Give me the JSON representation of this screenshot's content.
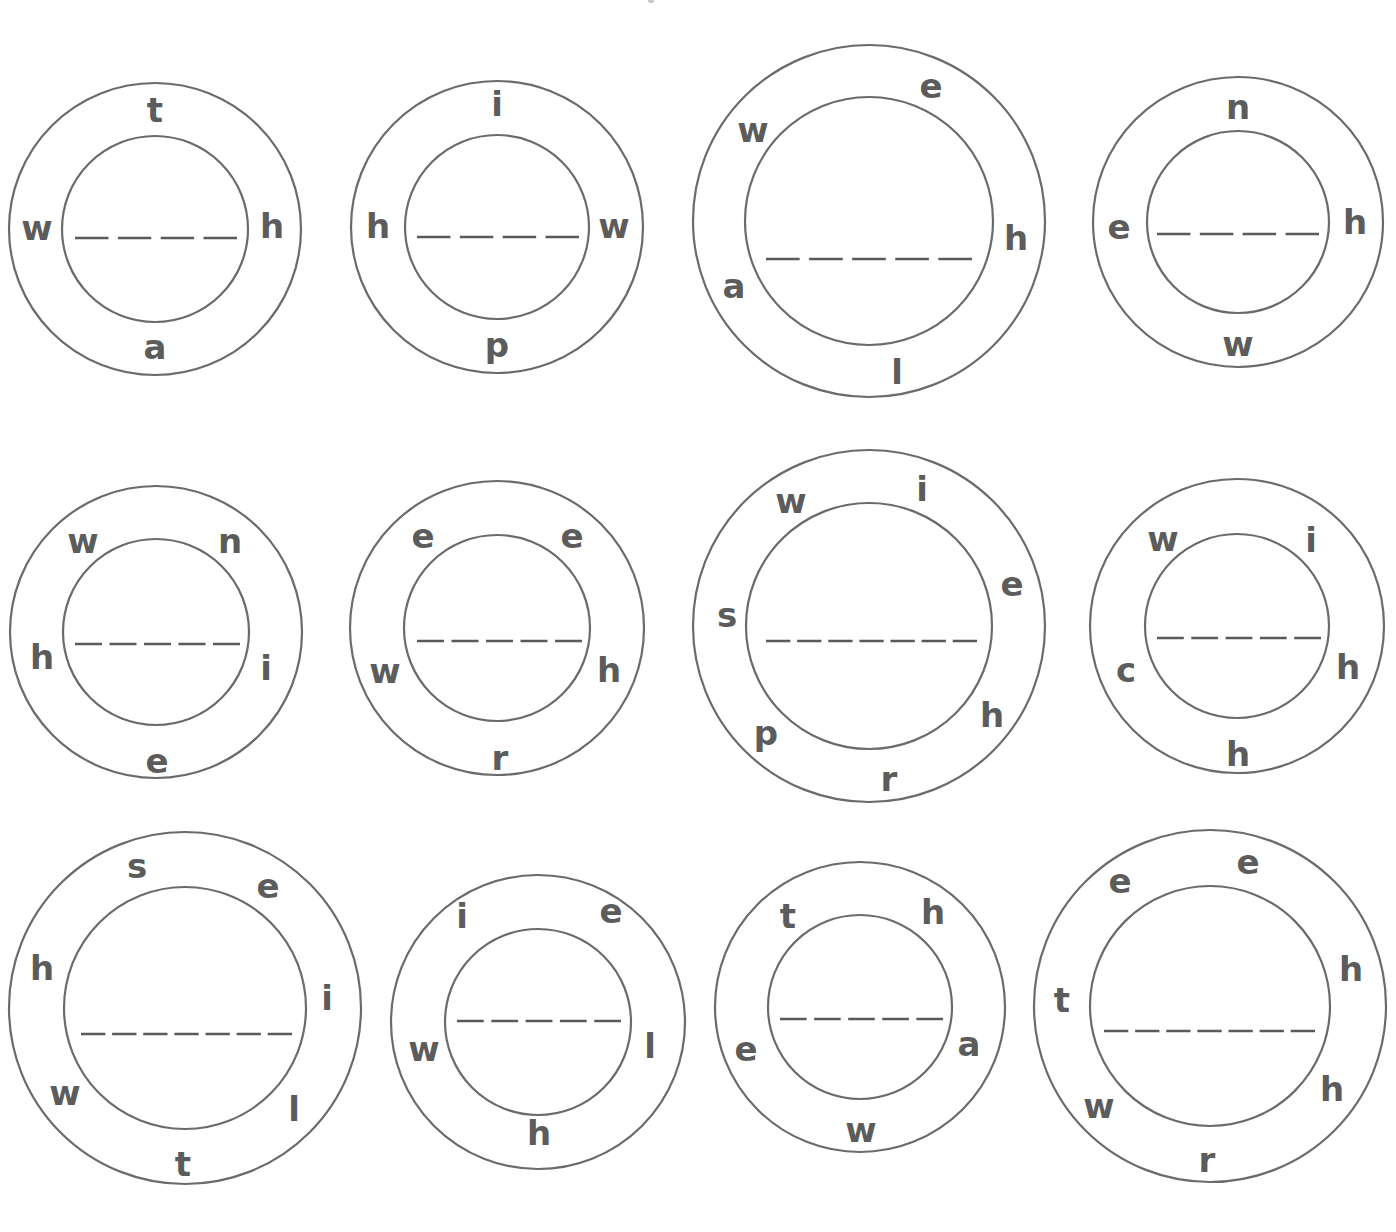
{
  "worksheet": {
    "description": "Letter wheel word puzzles: unscramble the letters around each ring and write the word on the dashed line",
    "ink_color": "#5c5c5c",
    "line_color": "#6b6b6b",
    "background": "#ffffff"
  },
  "wheels": [
    {
      "id": 1,
      "row": 1,
      "col": 1,
      "cx": 155,
      "cy": 229,
      "outer_r": 146,
      "inner_r": 93,
      "line": {
        "x1": 75,
        "x2": 237,
        "y": 238,
        "blanks": 4
      },
      "letters": [
        {
          "char": "t",
          "x": 155,
          "y": 110
        },
        {
          "char": "h",
          "x": 272,
          "y": 226
        },
        {
          "char": "a",
          "x": 155,
          "y": 347
        },
        {
          "char": "w",
          "x": 37,
          "y": 228
        }
      ]
    },
    {
      "id": 2,
      "row": 1,
      "col": 2,
      "cx": 497,
      "cy": 227,
      "outer_r": 146,
      "inner_r": 92,
      "line": {
        "x1": 417,
        "x2": 579,
        "y": 237,
        "blanks": 4
      },
      "letters": [
        {
          "char": "i",
          "x": 497,
          "y": 104
        },
        {
          "char": "w",
          "x": 614,
          "y": 226
        },
        {
          "char": "p",
          "x": 497,
          "y": 345
        },
        {
          "char": "h",
          "x": 378,
          "y": 226
        }
      ]
    },
    {
      "id": 3,
      "row": 1,
      "col": 3,
      "cx": 869,
      "cy": 221,
      "outer_r": 176,
      "inner_r": 124,
      "line": {
        "x1": 766,
        "x2": 972,
        "y": 259,
        "blanks": 5
      },
      "letters": [
        {
          "char": "e",
          "x": 931,
          "y": 86
        },
        {
          "char": "w",
          "x": 753,
          "y": 130
        },
        {
          "char": "h",
          "x": 1016,
          "y": 238
        },
        {
          "char": "a",
          "x": 734,
          "y": 286
        },
        {
          "char": "l",
          "x": 897,
          "y": 372
        }
      ]
    },
    {
      "id": 4,
      "row": 1,
      "col": 4,
      "cx": 1238,
      "cy": 222,
      "outer_r": 145,
      "inner_r": 91,
      "line": {
        "x1": 1157,
        "x2": 1319,
        "y": 234,
        "blanks": 4
      },
      "letters": [
        {
          "char": "n",
          "x": 1238,
          "y": 107
        },
        {
          "char": "e",
          "x": 1119,
          "y": 227
        },
        {
          "char": "h",
          "x": 1355,
          "y": 222
        },
        {
          "char": "w",
          "x": 1238,
          "y": 344
        }
      ]
    },
    {
      "id": 5,
      "row": 2,
      "col": 1,
      "cx": 156,
      "cy": 632,
      "outer_r": 146,
      "inner_r": 93,
      "line": {
        "x1": 75,
        "x2": 240,
        "y": 644,
        "blanks": 5
      },
      "letters": [
        {
          "char": "w",
          "x": 83,
          "y": 541
        },
        {
          "char": "n",
          "x": 230,
          "y": 541
        },
        {
          "char": "h",
          "x": 42,
          "y": 657
        },
        {
          "char": "i",
          "x": 266,
          "y": 668
        },
        {
          "char": "e",
          "x": 157,
          "y": 761
        }
      ]
    },
    {
      "id": 6,
      "row": 2,
      "col": 2,
      "cx": 497,
      "cy": 628,
      "outer_r": 147,
      "inner_r": 93,
      "line": {
        "x1": 417,
        "x2": 582,
        "y": 641,
        "blanks": 5
      },
      "letters": [
        {
          "char": "e",
          "x": 423,
          "y": 536
        },
        {
          "char": "e",
          "x": 572,
          "y": 536
        },
        {
          "char": "w",
          "x": 385,
          "y": 671
        },
        {
          "char": "h",
          "x": 609,
          "y": 670
        },
        {
          "char": "r",
          "x": 500,
          "y": 758
        }
      ]
    },
    {
      "id": 7,
      "row": 2,
      "col": 3,
      "cx": 869,
      "cy": 626,
      "outer_r": 176,
      "inner_r": 123,
      "line": {
        "x1": 766,
        "x2": 977,
        "y": 641,
        "blanks": 7
      },
      "letters": [
        {
          "char": "w",
          "x": 791,
          "y": 501
        },
        {
          "char": "i",
          "x": 922,
          "y": 489
        },
        {
          "char": "s",
          "x": 727,
          "y": 615
        },
        {
          "char": "e",
          "x": 1012,
          "y": 584
        },
        {
          "char": "p",
          "x": 766,
          "y": 733
        },
        {
          "char": "h",
          "x": 992,
          "y": 715
        },
        {
          "char": "r",
          "x": 889,
          "y": 779
        }
      ]
    },
    {
      "id": 8,
      "row": 2,
      "col": 4,
      "cx": 1237,
      "cy": 626,
      "outer_r": 147,
      "inner_r": 92,
      "line": {
        "x1": 1157,
        "x2": 1321,
        "y": 638,
        "blanks": 5
      },
      "letters": [
        {
          "char": "w",
          "x": 1163,
          "y": 539
        },
        {
          "char": "i",
          "x": 1311,
          "y": 540
        },
        {
          "char": "c",
          "x": 1126,
          "y": 670
        },
        {
          "char": "h",
          "x": 1348,
          "y": 667
        },
        {
          "char": "h",
          "x": 1238,
          "y": 754
        }
      ]
    },
    {
      "id": 9,
      "row": 3,
      "col": 1,
      "cx": 185,
      "cy": 1008,
      "outer_r": 176,
      "inner_r": 121,
      "line": {
        "x1": 81,
        "x2": 292,
        "y": 1034,
        "blanks": 7
      },
      "letters": [
        {
          "char": "s",
          "x": 137,
          "y": 866
        },
        {
          "char": "e",
          "x": 268,
          "y": 886
        },
        {
          "char": "h",
          "x": 42,
          "y": 968
        },
        {
          "char": "i",
          "x": 327,
          "y": 998
        },
        {
          "char": "w",
          "x": 65,
          "y": 1093
        },
        {
          "char": "l",
          "x": 294,
          "y": 1109
        },
        {
          "char": "t",
          "x": 183,
          "y": 1164
        }
      ]
    },
    {
      "id": 10,
      "row": 3,
      "col": 2,
      "cx": 538,
      "cy": 1022,
      "outer_r": 147,
      "inner_r": 93,
      "line": {
        "x1": 457,
        "x2": 621,
        "y": 1021,
        "blanks": 5
      },
      "letters": [
        {
          "char": "i",
          "x": 462,
          "y": 916
        },
        {
          "char": "e",
          "x": 611,
          "y": 911
        },
        {
          "char": "w",
          "x": 424,
          "y": 1049
        },
        {
          "char": "l",
          "x": 650,
          "y": 1046
        },
        {
          "char": "h",
          "x": 539,
          "y": 1133
        }
      ]
    },
    {
      "id": 11,
      "row": 3,
      "col": 3,
      "cx": 860,
      "cy": 1007,
      "outer_r": 145,
      "inner_r": 92,
      "line": {
        "x1": 780,
        "x2": 943,
        "y": 1019,
        "blanks": 5
      },
      "letters": [
        {
          "char": "t",
          "x": 788,
          "y": 916
        },
        {
          "char": "h",
          "x": 933,
          "y": 912
        },
        {
          "char": "e",
          "x": 746,
          "y": 1049
        },
        {
          "char": "a",
          "x": 969,
          "y": 1044
        },
        {
          "char": "w",
          "x": 861,
          "y": 1130
        }
      ]
    },
    {
      "id": 12,
      "row": 3,
      "col": 4,
      "cx": 1210,
      "cy": 1006,
      "outer_r": 176,
      "inner_r": 120,
      "line": {
        "x1": 1104,
        "x2": 1315,
        "y": 1031,
        "blanks": 7
      },
      "letters": [
        {
          "char": "e",
          "x": 1120,
          "y": 881
        },
        {
          "char": "e",
          "x": 1248,
          "y": 862
        },
        {
          "char": "h",
          "x": 1351,
          "y": 969
        },
        {
          "char": "t",
          "x": 1062,
          "y": 1000
        },
        {
          "char": "h",
          "x": 1332,
          "y": 1089
        },
        {
          "char": "w",
          "x": 1099,
          "y": 1106
        },
        {
          "char": "r",
          "x": 1207,
          "y": 1160
        }
      ]
    }
  ]
}
